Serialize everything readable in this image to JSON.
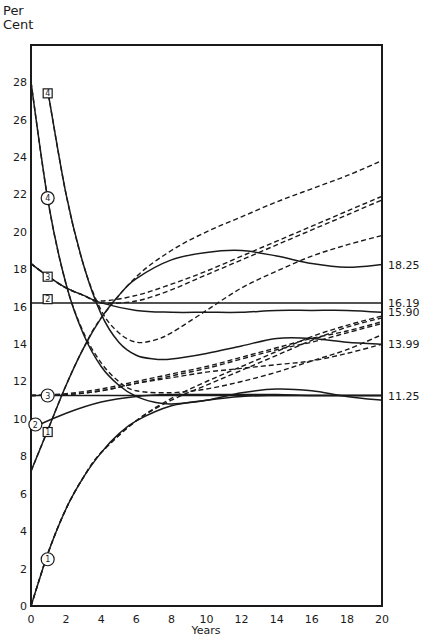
{
  "chart_data": {
    "type": "line",
    "title": "",
    "ylabel": "Per Cent",
    "ylabel_lines": [
      "Per",
      "Cent"
    ],
    "xlabel": "Years",
    "xlim": [
      0,
      20
    ],
    "ylim": [
      0,
      30
    ],
    "x_ticks": [
      0,
      2,
      4,
      6,
      8,
      10,
      12,
      14,
      16,
      18,
      20
    ],
    "y_ticks": [
      0,
      2,
      4,
      6,
      8,
      10,
      12,
      14,
      16,
      18,
      20,
      22,
      24,
      26,
      28
    ],
    "grid": false,
    "legend": "none (curves marked with circled and boxed numbers 1–4)",
    "right_annotations": [
      {
        "text": "18.25",
        "y": 18.25
      },
      {
        "text": "16.19",
        "y": 16.19
      },
      {
        "text": "15.90",
        "y": 15.7
      },
      {
        "text": "13.99",
        "y": 13.99
      },
      {
        "text": "11.25",
        "y": 11.25
      }
    ],
    "series": [
      {
        "name": "circle-1",
        "marker": "1",
        "marker_shape": "circle",
        "style": "solid",
        "x": [
          0,
          1,
          2,
          3,
          4,
          5,
          6,
          8,
          10,
          12,
          14,
          16,
          18,
          20
        ],
        "values": [
          0,
          2.9,
          5.2,
          6.9,
          8.2,
          9.2,
          9.9,
          10.7,
          11.0,
          11.2,
          11.25,
          11.25,
          11.25,
          11.25
        ]
      },
      {
        "name": "circle-2",
        "marker": "2",
        "marker_shape": "circle",
        "style": "solid",
        "x": [
          0,
          2,
          4,
          6,
          8,
          10,
          12,
          14,
          16,
          18,
          20
        ],
        "values": [
          9.5,
          10.3,
          10.9,
          11.2,
          11.3,
          11.3,
          11.3,
          11.3,
          11.25,
          11.25,
          11.25
        ]
      },
      {
        "name": "circle-3",
        "marker": "3",
        "marker_shape": "circle",
        "style": "solid",
        "x": [
          0,
          20
        ],
        "values": [
          11.25,
          11.25
        ]
      },
      {
        "name": "circle-4",
        "marker": "4",
        "marker_shape": "circle",
        "style": "solid",
        "x": [
          0,
          1,
          2,
          3,
          4,
          5,
          6,
          7,
          8,
          10,
          12,
          14,
          16,
          18,
          20
        ],
        "values": [
          28,
          21.5,
          17.2,
          14.5,
          12.8,
          11.8,
          11.2,
          10.9,
          10.8,
          11.0,
          11.4,
          11.6,
          11.5,
          11.2,
          11.0
        ]
      },
      {
        "name": "box-1",
        "marker": "1",
        "marker_shape": "square",
        "style": "solid",
        "x": [
          0,
          1,
          2,
          3,
          4,
          5,
          6,
          8,
          10,
          12,
          14,
          16,
          18,
          20
        ],
        "values": [
          7.2,
          9.5,
          11.8,
          13.8,
          15.4,
          16.6,
          17.5,
          18.5,
          18.9,
          19.0,
          18.7,
          18.3,
          18.1,
          18.25
        ]
      },
      {
        "name": "box-2",
        "marker": "2",
        "marker_shape": "square",
        "style": "solid",
        "x": [
          0,
          20
        ],
        "values": [
          16.19,
          16.19
        ]
      },
      {
        "name": "box-3",
        "marker": "3",
        "marker_shape": "square",
        "style": "solid",
        "x": [
          0,
          1,
          2,
          3,
          4,
          6,
          8,
          10,
          12,
          14,
          16,
          18,
          20
        ],
        "values": [
          18.3,
          17.6,
          17.0,
          16.6,
          16.2,
          15.8,
          15.7,
          15.7,
          15.7,
          15.8,
          15.8,
          15.8,
          15.7
        ]
      },
      {
        "name": "box-4",
        "marker": "4",
        "marker_shape": "square",
        "style": "solid",
        "x": [
          1,
          2,
          3,
          4,
          5,
          6,
          7,
          8,
          10,
          12,
          14,
          16,
          18,
          20
        ],
        "values": [
          27.3,
          22.0,
          18.2,
          15.6,
          14.1,
          13.4,
          13.2,
          13.2,
          13.5,
          13.9,
          14.3,
          14.3,
          14.1,
          13.99
        ]
      },
      {
        "name": "dashed-a",
        "marker": "",
        "style": "dashed",
        "x": [
          0,
          1,
          2,
          3,
          4,
          6,
          8,
          10,
          12,
          14,
          16,
          18,
          20
        ],
        "values": [
          0,
          2.9,
          5.2,
          6.9,
          8.2,
          9.9,
          11.0,
          11.8,
          12.6,
          13.4,
          14.2,
          14.9,
          15.4
        ]
      },
      {
        "name": "dashed-b",
        "marker": "",
        "style": "dashed",
        "x": [
          0,
          1,
          2,
          3,
          4,
          6,
          8,
          10,
          12,
          14,
          16,
          18,
          20
        ],
        "values": [
          0,
          2.9,
          5.2,
          6.9,
          8.2,
          9.9,
          11.1,
          12.0,
          12.8,
          13.6,
          14.4,
          15.0,
          15.5
        ]
      },
      {
        "name": "dashed-c",
        "marker": "",
        "style": "dashed",
        "x": [
          0,
          1,
          2,
          3,
          4,
          6,
          8,
          10,
          12,
          14,
          16,
          18,
          20
        ],
        "values": [
          7.2,
          9.5,
          11.8,
          13.8,
          15.4,
          17.6,
          19.0,
          20.0,
          20.8,
          21.6,
          22.3,
          23.0,
          23.8
        ]
      },
      {
        "name": "dashed-d",
        "marker": "",
        "style": "dashed",
        "x": [
          0,
          1,
          2,
          3,
          4,
          6,
          8,
          10,
          12,
          14,
          16,
          18,
          20
        ],
        "values": [
          18.3,
          17.6,
          17.0,
          16.6,
          16.3,
          16.6,
          17.2,
          17.9,
          18.7,
          19.5,
          20.3,
          21.1,
          21.9
        ]
      },
      {
        "name": "dashed-e",
        "marker": "",
        "style": "dashed",
        "x": [
          0,
          1,
          2,
          3,
          4,
          6,
          8,
          10,
          12,
          14,
          16,
          18,
          20
        ],
        "values": [
          18.3,
          17.6,
          17.0,
          16.6,
          16.2,
          16.3,
          16.9,
          17.7,
          18.5,
          19.3,
          20.1,
          20.9,
          21.7
        ]
      },
      {
        "name": "dashed-f",
        "marker": "",
        "style": "dashed",
        "x": [
          1,
          2,
          3,
          4,
          5,
          6,
          7,
          8,
          10,
          12,
          14,
          16,
          18,
          20
        ],
        "values": [
          27.3,
          22.0,
          18.2,
          15.8,
          14.6,
          14.1,
          14.2,
          14.6,
          15.8,
          17.0,
          17.9,
          18.7,
          19.3,
          19.8
        ]
      },
      {
        "name": "dashed-g",
        "marker": "",
        "style": "dashed",
        "x": [
          0,
          1,
          2,
          3,
          4,
          5,
          6,
          8,
          10,
          12,
          14,
          16,
          18,
          20
        ],
        "values": [
          28,
          21.5,
          17.2,
          14.6,
          13.0,
          12.0,
          11.5,
          11.4,
          11.6,
          12.0,
          12.5,
          13.1,
          13.7,
          14.5
        ]
      },
      {
        "name": "dashed-h",
        "marker": "",
        "style": "dashed",
        "x": [
          0,
          2,
          4,
          6,
          8,
          10,
          12,
          14,
          16,
          18,
          20
        ],
        "values": [
          11.25,
          11.3,
          11.5,
          11.9,
          12.3,
          12.7,
          13.2,
          13.7,
          14.1,
          14.6,
          15.1
        ]
      },
      {
        "name": "dashed-i",
        "marker": "",
        "style": "dashed",
        "x": [
          0,
          2,
          4,
          6,
          8,
          10,
          12,
          14,
          16,
          18,
          20
        ],
        "values": [
          11.25,
          11.35,
          11.6,
          12.0,
          12.4,
          12.8,
          13.3,
          13.8,
          14.3,
          14.7,
          15.2
        ]
      },
      {
        "name": "dashed-j",
        "marker": "",
        "style": "dashed",
        "x": [
          0,
          2,
          4,
          6,
          8,
          10,
          12,
          14,
          16,
          18,
          20
        ],
        "values": [
          11.25,
          11.3,
          11.5,
          11.9,
          12.2,
          12.5,
          12.7,
          12.9,
          13.1,
          13.5,
          13.99
        ]
      }
    ],
    "markers": [
      {
        "series": "circle-1",
        "label": "1",
        "shape": "circle",
        "x": 0.95,
        "y": 2.5
      },
      {
        "series": "circle-2",
        "label": "2",
        "shape": "circle",
        "x": 0.25,
        "y": 9.7
      },
      {
        "series": "circle-3",
        "label": "3",
        "shape": "circle",
        "x": 0.95,
        "y": 11.25
      },
      {
        "series": "circle-4",
        "label": "4",
        "shape": "circle",
        "x": 0.95,
        "y": 21.8
      },
      {
        "series": "box-1",
        "label": "1",
        "shape": "square",
        "x": 0.95,
        "y": 9.3
      },
      {
        "series": "box-2",
        "label": "2",
        "shape": "square",
        "x": 0.95,
        "y": 16.4
      },
      {
        "series": "box-3",
        "label": "3",
        "shape": "square",
        "x": 0.95,
        "y": 17.6
      },
      {
        "series": "box-4",
        "label": "4",
        "shape": "square",
        "x": 0.95,
        "y": 27.4
      }
    ]
  },
  "layout": {
    "plot_left": 31,
    "plot_right": 382,
    "plot_top": 45,
    "plot_bottom": 606,
    "x_min": 0,
    "x_max": 20,
    "y_zero_px": 606,
    "y_unit_px": 18.71
  },
  "labels": {
    "ylabel_line1": "Per",
    "ylabel_line2": "Cent",
    "xlabel": "Years"
  }
}
